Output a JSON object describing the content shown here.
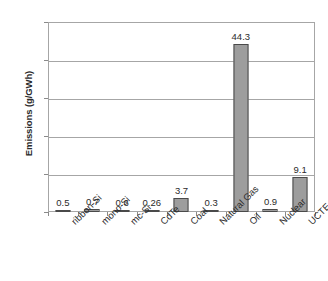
{
  "chart_data": {
    "type": "bar",
    "title": "",
    "xlabel": "",
    "ylabel": "Emissions (g/GWh)",
    "ylim": [
      0,
      50
    ],
    "ytick_labels": [
      "0",
      "10",
      "20",
      "30",
      "40",
      "50"
    ],
    "ytick_values": [
      0,
      10,
      20,
      30,
      40,
      50
    ],
    "grid": true,
    "legend": "none",
    "categories": [
      "ribbon-Si",
      "mono-Si",
      "mc-Si",
      "CdTe",
      "Coal",
      "Natural Gas",
      "Oil",
      "Nuclear",
      "UCTE avg."
    ],
    "values": [
      0.5,
      0.7,
      0.6,
      0.26,
      3.7,
      0.3,
      44.3,
      0.9,
      9.1
    ],
    "data_labels": [
      "0.5",
      "0.7",
      "0.6",
      "0.26",
      "3.7",
      "0.3",
      "44.3",
      "0.9",
      "9.1"
    ],
    "series": [
      {
        "name": "Emissions",
        "values": [
          0.5,
          0.7,
          0.6,
          0.26,
          3.7,
          0.3,
          44.3,
          0.9,
          9.1
        ]
      }
    ],
    "colors": {
      "bar_fill": "#9d9d9d",
      "bar_border": "#4a4a4a",
      "gridline": "#a6a6a6",
      "axis": "#a6a6a6",
      "text": "#2b2b2b",
      "background": "#ffffff"
    }
  }
}
